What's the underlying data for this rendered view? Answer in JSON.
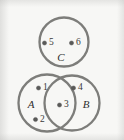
{
  "figure": {
    "background_color": "#f7f7f5",
    "stroke_color": "#7d7d7a",
    "dot_color": "#5a5a58",
    "label_color": "#2f2f2d"
  },
  "sets": [
    {
      "name": "set-c",
      "label": "C",
      "cx": 64,
      "cy": 42,
      "r": 24.5,
      "label_x": 61,
      "label_y": 58
    },
    {
      "name": "set-a",
      "label": "A",
      "cx": 47,
      "cy": 103,
      "r": 28.5,
      "label_x": 31,
      "label_y": 105
    },
    {
      "name": "set-b",
      "label": "B",
      "cx": 72,
      "cy": 103,
      "r": 27.5,
      "label_x": 86,
      "label_y": 105
    }
  ],
  "points": [
    {
      "name": "point-5",
      "label": "5",
      "dot_x": 44.5,
      "dot_y": 43,
      "label_x": 49,
      "label_y": 43,
      "region": "C"
    },
    {
      "name": "point-6",
      "label": "6",
      "dot_x": 71.5,
      "dot_y": 43,
      "label_x": 76,
      "label_y": 43,
      "region": "C"
    },
    {
      "name": "point-1",
      "label": "1",
      "dot_x": 38.5,
      "dot_y": 88,
      "label_x": 43,
      "label_y": 88,
      "region": "A only"
    },
    {
      "name": "point-2",
      "label": "2",
      "dot_x": 35.5,
      "dot_y": 119.5,
      "label_x": 40,
      "label_y": 119.5,
      "region": "A only"
    },
    {
      "name": "point-3",
      "label": "3",
      "dot_x": 59.5,
      "dot_y": 105,
      "label_x": 64,
      "label_y": 105,
      "region": "A and B"
    },
    {
      "name": "point-4",
      "label": "4",
      "dot_x": 73.5,
      "dot_y": 88,
      "label_x": 78,
      "label_y": 88,
      "region": "B only"
    }
  ]
}
